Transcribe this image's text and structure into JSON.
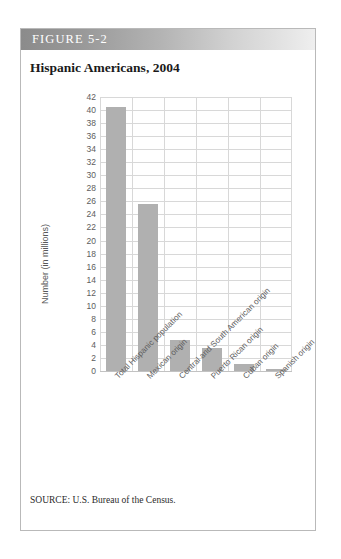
{
  "figure": {
    "label": "FIGURE 5-2",
    "title": "Hispanic Americans, 2004",
    "source": "SOURCE: U.S. Bureau of the Census."
  },
  "colors": {
    "bar_fill": "#b0b0b0",
    "gridline": "#d8d8d8",
    "header_dark": "#8b8b8b",
    "header_light": "#efefef",
    "tick_text": "#5d5d5d",
    "box_border": "#b9b9b9"
  },
  "chart_data": {
    "type": "bar",
    "title": "Hispanic Americans, 2004",
    "xlabel": "",
    "ylabel": "Number (in millions)",
    "ylim": [
      0,
      42
    ],
    "ytick_step": 2,
    "yticks": [
      0,
      2,
      4,
      6,
      8,
      10,
      12,
      14,
      16,
      18,
      20,
      22,
      24,
      26,
      28,
      30,
      32,
      34,
      36,
      38,
      40,
      42
    ],
    "ytick_labels": [
      "0",
      "2",
      "4",
      "6",
      "8",
      "10",
      "12",
      "14",
      "16",
      "18",
      "20",
      "22",
      "24",
      "26",
      "28",
      "30",
      "32",
      "34",
      "36",
      "38",
      "40",
      "42"
    ],
    "grid": true,
    "legend": null,
    "categories": [
      "Total Hispanic population",
      "Mexican origin",
      "Central and South American origin",
      "Puerto Rican origin",
      "Cuban origin",
      "Spanish origin"
    ],
    "values": [
      40.4,
      25.6,
      4.8,
      3.5,
      1.0,
      0.35
    ]
  }
}
